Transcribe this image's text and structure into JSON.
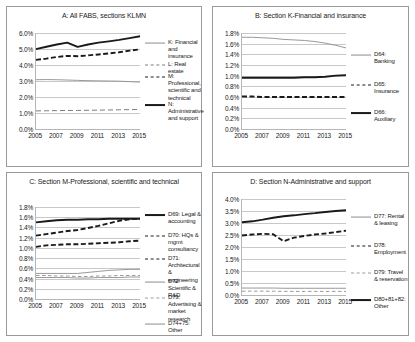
{
  "figure": {
    "x_tick_labels": [
      "2005",
      "2007",
      "2009",
      "2011",
      "2013",
      "2015"
    ]
  },
  "chart_data": [
    {
      "id": "A",
      "type": "line",
      "title": "A: All FABS, sections KLMN",
      "xlabel": "",
      "ylabel": "",
      "x": [
        2005,
        2006,
        2007,
        2008,
        2009,
        2010,
        2011,
        2012,
        2013,
        2014,
        2015
      ],
      "ylim": [
        0.0,
        6.0
      ],
      "ytick_labels": [
        "0.0%",
        "1.0%",
        "2.0%",
        "3.0%",
        "4.0%",
        "5.0%",
        "6.0%"
      ],
      "yticks": [
        0.0,
        1.0,
        2.0,
        3.0,
        4.0,
        5.0,
        6.0
      ],
      "grid": true,
      "legend_position": "right",
      "series": [
        {
          "name": "K: Financial and insurance",
          "style": "thin-solid",
          "values": [
            3.08,
            3.09,
            3.08,
            3.06,
            3.04,
            3.02,
            3.01,
            3.0,
            2.99,
            2.96,
            2.93
          ]
        },
        {
          "name": "L: Real estate",
          "style": "long-dash",
          "values": [
            1.13,
            1.14,
            1.15,
            1.16,
            1.16,
            1.17,
            1.18,
            1.19,
            1.2,
            1.21,
            1.22
          ]
        },
        {
          "name": "M: Professional, scientific and technical",
          "style": "thick-dash",
          "values": [
            4.32,
            4.4,
            4.5,
            4.57,
            4.55,
            4.6,
            4.66,
            4.72,
            4.8,
            4.9,
            4.98
          ]
        },
        {
          "name": "N: Administrative and support",
          "style": "thick-solid",
          "values": [
            4.99,
            5.14,
            5.28,
            5.4,
            5.13,
            5.28,
            5.4,
            5.48,
            5.57,
            5.68,
            5.8
          ]
        }
      ]
    },
    {
      "id": "B",
      "type": "line",
      "title": "B: Section K-Financial and insurance",
      "xlabel": "",
      "ylabel": "",
      "x": [
        2005,
        2006,
        2007,
        2008,
        2009,
        2010,
        2011,
        2012,
        2013,
        2014,
        2015
      ],
      "ylim": [
        0.0,
        1.8
      ],
      "ytick_labels": [
        "0.0%",
        "0.2%",
        "0.4%",
        "0.6%",
        "0.8%",
        "1.0%",
        "1.2%",
        "1.4%",
        "1.6%",
        "1.8%"
      ],
      "yticks": [
        0.0,
        0.2,
        0.4,
        0.6,
        0.8,
        1.0,
        1.2,
        1.4,
        1.6,
        1.8
      ],
      "grid": true,
      "legend_position": "right",
      "series": [
        {
          "name": "D64: Banking",
          "style": "thin-solid",
          "values": [
            1.72,
            1.72,
            1.71,
            1.7,
            1.68,
            1.67,
            1.66,
            1.64,
            1.61,
            1.57,
            1.52
          ]
        },
        {
          "name": "D65: Insurance",
          "style": "thick-dash",
          "values": [
            0.61,
            0.61,
            0.6,
            0.6,
            0.6,
            0.6,
            0.6,
            0.6,
            0.6,
            0.6,
            0.6
          ]
        },
        {
          "name": "D66: Auxiliary",
          "style": "thick-solid",
          "values": [
            0.96,
            0.96,
            0.96,
            0.96,
            0.96,
            0.96,
            0.97,
            0.97,
            0.98,
            1.0,
            1.01
          ]
        }
      ]
    },
    {
      "id": "C",
      "type": "line",
      "title": "C: Section M-Professional, scientific and technical",
      "xlabel": "",
      "ylabel": "",
      "x": [
        2005,
        2006,
        2007,
        2008,
        2009,
        2010,
        2011,
        2012,
        2013,
        2014,
        2015
      ],
      "ylim": [
        0.0,
        1.8
      ],
      "ytick_labels": [
        "0.0%",
        "0.2%",
        "0.4%",
        "0.6%",
        "0.8%",
        "1.0%",
        "1.2%",
        "1.4%",
        "1.6%",
        "1.8%"
      ],
      "yticks": [
        0.0,
        0.2,
        0.4,
        0.6,
        0.8,
        1.0,
        1.2,
        1.4,
        1.6,
        1.8
      ],
      "grid": true,
      "legend_position": "right",
      "series": [
        {
          "name": "D69: Legal & accounting",
          "style": "thick-solid",
          "values": [
            1.5,
            1.52,
            1.54,
            1.55,
            1.55,
            1.56,
            1.56,
            1.57,
            1.57,
            1.57,
            1.57
          ]
        },
        {
          "name": "D70: HQs & mgmt consultancy",
          "style": "thick-dash",
          "values": [
            1.24,
            1.27,
            1.3,
            1.33,
            1.35,
            1.39,
            1.43,
            1.48,
            1.53,
            1.56,
            1.57
          ]
        },
        {
          "name": "D71: Architectural & engineering",
          "style": "thick-dash",
          "values": [
            1.02,
            1.05,
            1.06,
            1.07,
            1.07,
            1.08,
            1.09,
            1.1,
            1.11,
            1.13,
            1.14
          ]
        },
        {
          "name": "D72: Scientific & R&D",
          "style": "thin-solid",
          "values": [
            0.5,
            0.5,
            0.5,
            0.5,
            0.5,
            0.52,
            0.54,
            0.56,
            0.57,
            0.58,
            0.58
          ]
        },
        {
          "name": "D73: Advertising & market research",
          "style": "short-dash",
          "values": [
            0.46,
            0.46,
            0.45,
            0.45,
            0.44,
            0.44,
            0.45,
            0.45,
            0.46,
            0.46,
            0.46
          ]
        },
        {
          "name": "D74+75: Other",
          "style": "thin-solid",
          "values": [
            0.42,
            0.42,
            0.42,
            0.42,
            0.41,
            0.41,
            0.42,
            0.42,
            0.42,
            0.43,
            0.43
          ]
        }
      ]
    },
    {
      "id": "D",
      "type": "line",
      "title": "D: Section N-Administrative and support",
      "xlabel": "",
      "ylabel": "",
      "x": [
        2005,
        2006,
        2007,
        2008,
        2009,
        2010,
        2011,
        2012,
        2013,
        2014,
        2015
      ],
      "ylim": [
        0.0,
        4.0
      ],
      "ytick_labels": [
        "0.0%",
        "0.5%",
        "1.0%",
        "1.5%",
        "2.0%",
        "2.5%",
        "3.0%",
        "3.5%",
        "4.0%"
      ],
      "yticks": [
        0.0,
        0.5,
        1.0,
        1.5,
        2.0,
        2.5,
        3.0,
        3.5,
        4.0
      ],
      "grid": true,
      "legend_position": "right",
      "series": [
        {
          "name": "D77: Rental & leasing",
          "style": "thin-solid",
          "values": [
            0.29,
            0.29,
            0.29,
            0.29,
            0.28,
            0.28,
            0.28,
            0.28,
            0.28,
            0.28,
            0.28
          ]
        },
        {
          "name": "D78: Employment",
          "style": "thick-dash",
          "values": [
            2.48,
            2.52,
            2.55,
            2.53,
            2.24,
            2.39,
            2.46,
            2.52,
            2.56,
            2.62,
            2.68
          ]
        },
        {
          "name": "D79: Travel & reservation",
          "style": "short-dash",
          "values": [
            0.16,
            0.16,
            0.16,
            0.16,
            0.15,
            0.15,
            0.15,
            0.15,
            0.15,
            0.15,
            0.15
          ]
        },
        {
          "name": "D80+81+82: Other",
          "style": "thick-solid",
          "values": [
            3.03,
            3.07,
            3.14,
            3.22,
            3.28,
            3.32,
            3.37,
            3.41,
            3.46,
            3.5,
            3.53
          ]
        }
      ]
    }
  ]
}
